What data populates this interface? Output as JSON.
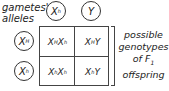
{
  "labels": {
    "gametes_line1": "gametes'",
    "gametes_line2": "alleles",
    "offspring_line1": "possible",
    "offspring_line2": "genotypes",
    "offspring_line3": "of F",
    "offspring_line3_sub": "1",
    "offspring_line4": "offspring"
  },
  "top_alleles": [
    {
      "base": "X",
      "sup": "h"
    },
    {
      "base": "Y",
      "sup": ""
    }
  ],
  "left_alleles": [
    {
      "base": "X",
      "sup": "H"
    },
    {
      "base": "X",
      "sup": "h"
    }
  ],
  "cells": [
    [
      {
        "a": "X",
        "a_sup": "H",
        "b": "X",
        "b_sup": "h"
      },
      {
        "a": "X",
        "a_sup": "H",
        "b": "Y",
        "b_sup": ""
      }
    ],
    [
      {
        "a": "X",
        "a_sup": "h",
        "b": "X",
        "b_sup": "h"
      },
      {
        "a": "X",
        "a_sup": "h",
        "b": "Y",
        "b_sup": ""
      }
    ]
  ]
}
